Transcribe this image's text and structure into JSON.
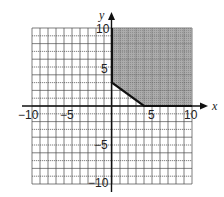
{
  "chart_data": {
    "type": "area",
    "title": "",
    "xlabel": "x",
    "ylabel": "y",
    "xlim": [
      -10,
      10
    ],
    "ylim": [
      -10,
      10
    ],
    "grid": true,
    "x_ticks": [
      "-10",
      "-5",
      "5",
      "10"
    ],
    "y_ticks": [
      "10",
      "5",
      "-5",
      "-10"
    ],
    "shaded_region": {
      "description": "Feasible region x >= 0, y >= 0, 3x + 4y >= 12 (shaded, clipped to grid)",
      "vertices": [
        [
          0,
          3
        ],
        [
          4,
          0
        ],
        [
          10,
          0
        ],
        [
          10,
          10
        ],
        [
          0,
          10
        ]
      ],
      "fill": "#9a9a9a"
    },
    "boundary": [
      [
        0,
        10
      ],
      [
        0,
        3
      ],
      [
        4,
        0
      ],
      [
        10,
        0
      ]
    ]
  },
  "labels": {
    "x_axis": "x",
    "y_axis": "y",
    "x_neg10": "−10",
    "x_neg5": "−5",
    "x_5": "5",
    "x_10": "10",
    "y_10": "10",
    "y_5": "5",
    "y_neg5": "−5",
    "y_neg10": "−10"
  }
}
